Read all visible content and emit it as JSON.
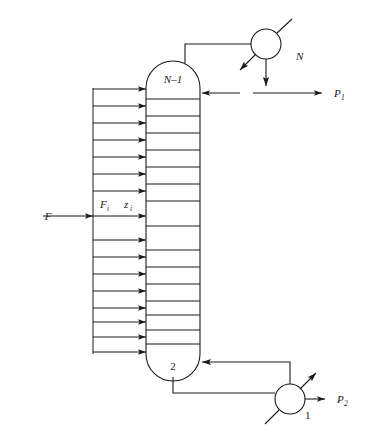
{
  "diagram": {
    "type": "process-flow-diagram",
    "colors": {
      "line": "#1a1a1a",
      "text": "#1a1a1a",
      "background": "#ffffff"
    },
    "column": {
      "top_stage_label": "N–1",
      "bottom_stage_label": "2",
      "tray_count": 16
    },
    "units": [
      {
        "id": "condenser",
        "label": "N",
        "shape": "circle"
      },
      {
        "id": "reboiler",
        "label": "1",
        "shape": "circle"
      }
    ],
    "streams": [
      {
        "id": "feed",
        "label": "F"
      },
      {
        "id": "feed-component-flow",
        "label": "F",
        "sub": "i"
      },
      {
        "id": "feed-composition",
        "label": "z",
        "sub": "i"
      },
      {
        "id": "top-product",
        "label": "P",
        "sub": "1"
      },
      {
        "id": "bottom-product",
        "label": "P",
        "sub": "2"
      }
    ],
    "labels": {
      "feed": "F",
      "feed_i_base": "F",
      "feed_i_sub": "i",
      "z_i_base": "z",
      "z_i_sub": "i",
      "stage_n_minus_1": "N–1",
      "stage_2": "2",
      "condenser": "N",
      "reboiler": "1",
      "product_1_base": "P",
      "product_1_sub": "1",
      "product_2_base": "P",
      "product_2_sub": "2"
    }
  }
}
